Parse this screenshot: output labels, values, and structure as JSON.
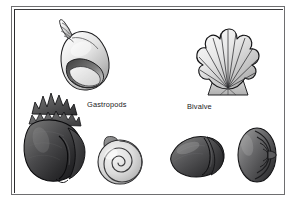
{
  "figure": {
    "background_color": "#ffffff",
    "frame_color": "#6e6e70",
    "frame_inner_color": "#2b2b2d"
  },
  "labels": {
    "gastropods": "Gastropods",
    "bivalve": "Bivalve"
  },
  "specimens": [
    {
      "id": "whelk",
      "name": "whelk-shell",
      "group": "Gastropods",
      "description": "Tall spired whelk shell, light gray, tilted left",
      "fill_light": "#efefef",
      "fill_mid": "#c3c3c3",
      "fill_dark": "#6b6b6b",
      "outline": "#1e1e20"
    },
    {
      "id": "scallop",
      "name": "scallop-shell",
      "group": "Bivalve",
      "description": "Fan-shaped scallop with radiating ribs and scalloped margin",
      "rib_count": 9,
      "fill_light": "#f2f2f2",
      "fill_mid": "#bdbdbd",
      "fill_dark": "#8e8e8e",
      "outline": "#141416"
    },
    {
      "id": "conch",
      "name": "conch-shell",
      "group": "Gastropods",
      "description": "Large dark conch with spiked spire and flared aperture",
      "fill_light": "#6a6a6a",
      "fill_mid": "#3a3a3c",
      "fill_dark": "#171719",
      "outline": "#0d0d0f"
    },
    {
      "id": "snail",
      "name": "spiral-snail-shell",
      "group": "Gastropods",
      "description": "Flat coiled planispiral snail shell, pale gray",
      "whorl_count": 3,
      "fill_light": "#e6e6e6",
      "fill_mid": "#c8c8c8",
      "fill_dark": "#8a8a8a",
      "outline": "#2a2a2c"
    },
    {
      "id": "clam",
      "name": "clam-shell",
      "group": "Bivalve",
      "description": "Dark rounded clam valve seen obliquely",
      "fill_light": "#6d6d6d",
      "fill_mid": "#4a4a4c",
      "fill_dark": "#2a2a2c",
      "outline": "#141416"
    },
    {
      "id": "ribbed",
      "name": "ribbed-shell",
      "group": "Bivalve",
      "description": "Dark shell with concentric ribs, viewed from side",
      "rib_count": 4,
      "fill_light": "#8e8e8e",
      "fill_mid": "#5e5e60",
      "fill_dark": "#313133",
      "outline": "#121214"
    }
  ]
}
